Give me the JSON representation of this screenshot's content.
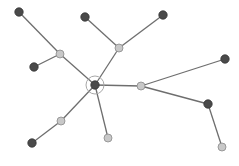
{
  "diagram": {
    "type": "tree-network",
    "colors": {
      "background": "#ffffff",
      "edge": "#6e6e6e",
      "dark_node": "#4a4a4a",
      "light_node": "#c8c8c8",
      "ring": "#a8a8a8"
    },
    "center": {
      "id": "c",
      "x": 95,
      "y": 85,
      "ring_radius": 9
    },
    "nodes": [
      {
        "id": "c",
        "x": 95,
        "y": 85,
        "kind": "dark",
        "selected": true
      },
      {
        "id": "l1",
        "x": 60,
        "y": 54,
        "kind": "light"
      },
      {
        "id": "d1",
        "x": 19,
        "y": 12,
        "kind": "dark"
      },
      {
        "id": "d2",
        "x": 34,
        "y": 67,
        "kind": "dark"
      },
      {
        "id": "l2",
        "x": 119,
        "y": 48,
        "kind": "light"
      },
      {
        "id": "d3",
        "x": 85,
        "y": 17,
        "kind": "dark"
      },
      {
        "id": "d4",
        "x": 163,
        "y": 15,
        "kind": "dark"
      },
      {
        "id": "l3",
        "x": 141,
        "y": 86,
        "kind": "light"
      },
      {
        "id": "d5",
        "x": 225,
        "y": 59,
        "kind": "dark"
      },
      {
        "id": "d6",
        "x": 208,
        "y": 104,
        "kind": "dark"
      },
      {
        "id": "l4",
        "x": 222,
        "y": 147,
        "kind": "light"
      },
      {
        "id": "l5",
        "x": 61,
        "y": 121,
        "kind": "light"
      },
      {
        "id": "d7",
        "x": 32,
        "y": 143,
        "kind": "dark"
      },
      {
        "id": "l6",
        "x": 108,
        "y": 138,
        "kind": "light"
      }
    ],
    "edges": [
      [
        "c",
        "l1"
      ],
      [
        "l1",
        "d1"
      ],
      [
        "l1",
        "d2"
      ],
      [
        "c",
        "l2"
      ],
      [
        "l2",
        "d3"
      ],
      [
        "l2",
        "d4"
      ],
      [
        "c",
        "l3"
      ],
      [
        "l3",
        "d5"
      ],
      [
        "l3",
        "d6"
      ],
      [
        "d6",
        "l4"
      ],
      [
        "c",
        "l5"
      ],
      [
        "l5",
        "d7"
      ],
      [
        "c",
        "l6"
      ]
    ]
  }
}
